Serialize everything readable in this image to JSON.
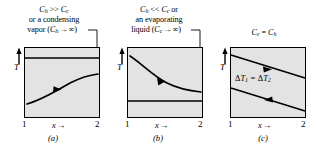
{
  "figure": {
    "background_color": "#ffffff",
    "plot_fill_color": "#e3e3e3",
    "line_color": "#000000"
  },
  "panels": [
    {
      "id": "a",
      "caption": "(a)",
      "annotation_lines": [
        "C_h >> C_c",
        "or a condensing",
        "vapor (C_h → ∞)"
      ],
      "annotation_parts": {
        "line1_var1": "C",
        "line1_sub1": "h",
        "line1_op": ">>",
        "line1_var2": "C",
        "line1_sub2": "c",
        "line2": "or a condensing",
        "line3_pre": "vapor (",
        "line3_var": "C",
        "line3_sub": "h",
        "line3_arrow": "→",
        "line3_inf": "∞",
        "line3_post": ")"
      },
      "y_axis_label": "T",
      "x_axis_label": "x",
      "x_axis_arrow": "→",
      "x_tick_left": "1",
      "x_tick_right": "2",
      "hot_stream": {
        "shape": "horizontal",
        "description": "constant hot temperature (condensing vapor)"
      },
      "cold_stream": {
        "shape": "rising-curve",
        "description": "cold stream temperature rises toward hot"
      }
    },
    {
      "id": "b",
      "caption": "(b)",
      "annotation_lines": [
        "C_h << C_c or",
        "an evaporating",
        "liquid (C_c → ∞)"
      ],
      "annotation_parts": {
        "line1_var1": "C",
        "line1_sub1": "h",
        "line1_op": "<<",
        "line1_var2": "C",
        "line1_sub2": "c",
        "line1_post": "or",
        "line2": "an evaporating",
        "line3_pre": "liquid (",
        "line3_var": "C",
        "line3_sub": "c",
        "line3_arrow": "→",
        "line3_inf": "∞",
        "line3_post": ")"
      },
      "y_axis_label": "T",
      "x_axis_label": "x",
      "x_axis_arrow": "→",
      "x_tick_left": "1",
      "x_tick_right": "2",
      "hot_stream": {
        "shape": "falling-curve",
        "description": "hot stream temperature falls toward cold"
      },
      "cold_stream": {
        "shape": "horizontal",
        "description": "constant cold temperature (evaporating liquid)"
      }
    },
    {
      "id": "c",
      "caption": "(c)",
      "annotation_parts": {
        "var1": "C",
        "sub1": "c",
        "op": "=",
        "var2": "C",
        "sub2": "h"
      },
      "annotation_lines": [
        "C_c = C_h"
      ],
      "y_axis_label": "T",
      "x_axis_label": "x",
      "x_axis_arrow": "→",
      "x_tick_left": "1",
      "x_tick_right": "2",
      "delta_label": {
        "delta": "Δ",
        "var": "T",
        "sub1": "1",
        "op": "=",
        "var2": "T",
        "sub2": "2",
        "full": "ΔT₁ = ΔT₂"
      },
      "hot_stream": {
        "shape": "descending-line",
        "description": "hot stream linear decline"
      },
      "cold_stream": {
        "shape": "descending-line",
        "description": "cold stream linear decline, parallel"
      }
    }
  ]
}
